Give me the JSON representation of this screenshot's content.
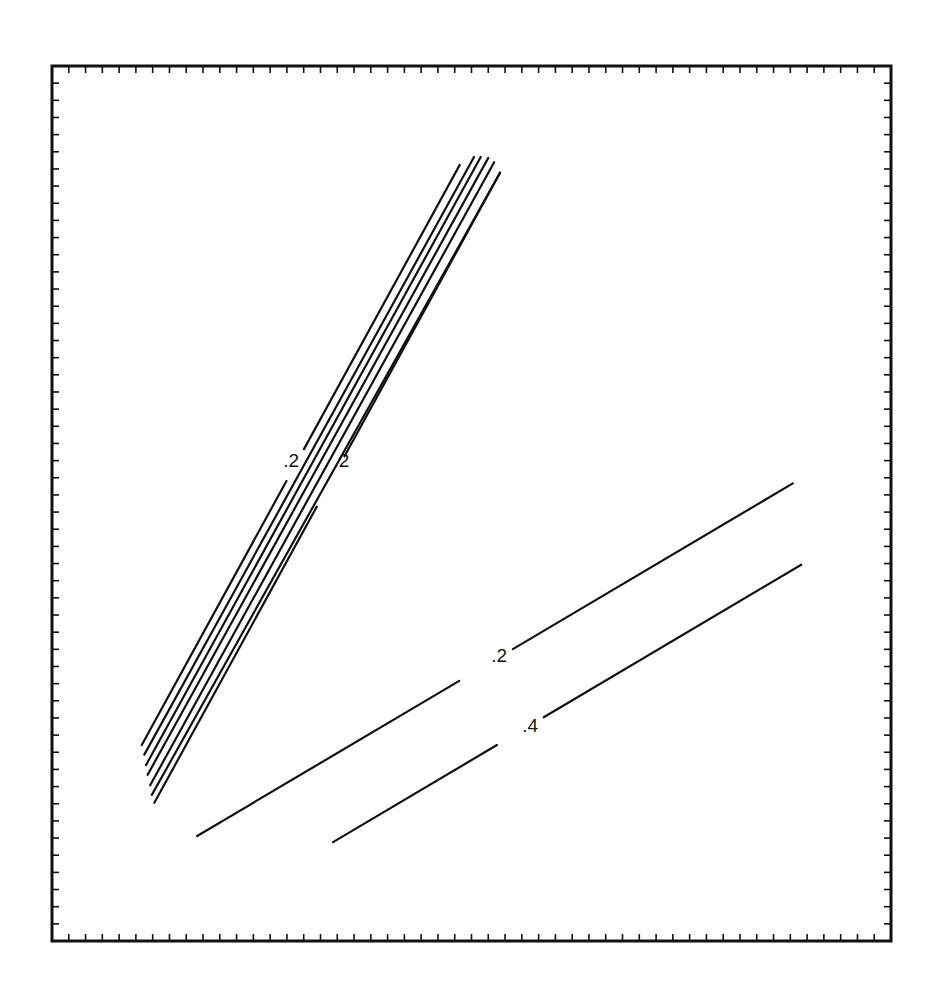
{
  "chart_data": {
    "type": "line",
    "title": "",
    "xlabel": "",
    "ylabel": "",
    "xlim": [
      0,
      1
    ],
    "ylim": [
      0,
      1
    ],
    "grid": false,
    "ticks": {
      "x_divisions": 50,
      "y_divisions": 51,
      "labels": false
    },
    "contours": [
      {
        "name": "bundle-1",
        "level": "0.2",
        "points": [
          [
            0.107,
            0.224
          ],
          [
            0.486,
            0.887
          ]
        ],
        "label": ".2",
        "label_at": [
          0.285,
          0.547
        ],
        "gap": [
          0.455,
          0.51
        ]
      },
      {
        "name": "bundle-2",
        "level": "",
        "points": [
          [
            0.11,
            0.213
          ],
          [
            0.503,
            0.896
          ]
        ]
      },
      {
        "name": "bundle-3",
        "level": "",
        "points": [
          [
            0.112,
            0.201
          ],
          [
            0.511,
            0.896
          ]
        ]
      },
      {
        "name": "bundle-4",
        "level": "",
        "points": [
          [
            0.114,
            0.19
          ],
          [
            0.52,
            0.895
          ]
        ]
      },
      {
        "name": "bundle-5",
        "level": "",
        "points": [
          [
            0.117,
            0.178
          ],
          [
            0.527,
            0.89
          ]
        ]
      },
      {
        "name": "bundle-6",
        "level": "",
        "points": [
          [
            0.119,
            0.167
          ],
          [
            0.534,
            0.878
          ]
        ]
      },
      {
        "name": "bundle-7",
        "level": "0.2",
        "points": [
          [
            0.122,
            0.158
          ],
          [
            0.534,
            0.878
          ]
        ],
        "label": ".2",
        "label_at": [
          0.345,
          0.547
        ],
        "gap": [
          0.47,
          0.55
        ]
      },
      {
        "name": "line-lower-a",
        "level": "0.2",
        "points": [
          [
            0.173,
            0.12
          ],
          [
            0.883,
            0.523
          ]
        ],
        "label": ".2",
        "label_at": [
          0.533,
          0.325
        ],
        "gap": [
          0.44,
          0.53
        ]
      },
      {
        "name": "line-lower-b",
        "level": "0.4",
        "points": [
          [
            0.335,
            0.113
          ],
          [
            0.893,
            0.43
          ]
        ],
        "label": ".4",
        "label_at": [
          0.57,
          0.245
        ],
        "gap": [
          0.35,
          0.45
        ]
      }
    ]
  }
}
